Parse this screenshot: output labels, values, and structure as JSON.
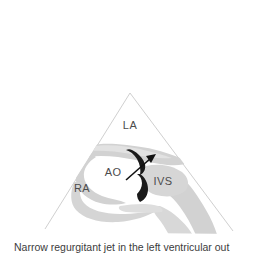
{
  "figure": {
    "caption": "Narrow regurgitant jet in the left ventricular out",
    "sector": {
      "apex_label": "",
      "outline_color": "#c9c9c9"
    },
    "colors": {
      "background": "#ffffff",
      "tissue_gray": "#d2d2d2",
      "tissue_gray_light": "#e0e0e0",
      "jet_black": "#1a1a1a",
      "label_text": "#4c4c4c",
      "sector_line": "#c9c9c9",
      "caption_text": "#3c3c3c"
    },
    "labels": [
      {
        "id": "la",
        "text": "LA",
        "x": 130,
        "y": 129,
        "meaning": "left-atrium"
      },
      {
        "id": "ao",
        "text": "AO",
        "x": 113,
        "y": 176,
        "meaning": "aorta"
      },
      {
        "id": "ra",
        "text": "RA",
        "x": 82,
        "y": 192,
        "meaning": "right-atrium"
      },
      {
        "id": "ivs",
        "text": "IVS",
        "x": 163,
        "y": 185,
        "meaning": "interventricular-septum"
      }
    ],
    "annotations": [
      {
        "id": "regurgitant-jet-arrow",
        "type": "arrow",
        "from_x": 126,
        "from_y": 180,
        "to_x": 155,
        "to_y": 155,
        "meaning": "narrow regurgitant jet direction"
      }
    ]
  }
}
